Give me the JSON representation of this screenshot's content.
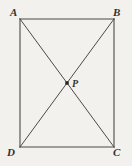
{
  "figure": {
    "name": "rectangle-with-diagonals",
    "canvas": {
      "width": 132,
      "height": 166
    },
    "background_color": "#f2f1ee",
    "stroke_color": "#4a4a4a",
    "label_color": "#33312f",
    "vertices": [
      {
        "id": "A",
        "label": "A",
        "x": 20,
        "y": 19,
        "label_position": "above-left"
      },
      {
        "id": "B",
        "label": "B",
        "x": 114,
        "y": 19,
        "label_position": "above-right"
      },
      {
        "id": "C",
        "label": "C",
        "x": 114,
        "y": 147,
        "label_position": "below-right"
      },
      {
        "id": "D",
        "label": "D",
        "x": 20,
        "y": 147,
        "label_position": "below-left"
      }
    ],
    "interior_points": [
      {
        "id": "P",
        "label": "P",
        "x": 67,
        "y": 83,
        "marker": "filled-square",
        "label_position": "right"
      }
    ],
    "sides": [
      {
        "from": "A",
        "to": "B"
      },
      {
        "from": "B",
        "to": "C"
      },
      {
        "from": "C",
        "to": "D"
      },
      {
        "from": "D",
        "to": "A"
      }
    ],
    "diagonals": [
      {
        "from": "A",
        "to": "C"
      },
      {
        "from": "B",
        "to": "D"
      }
    ]
  }
}
